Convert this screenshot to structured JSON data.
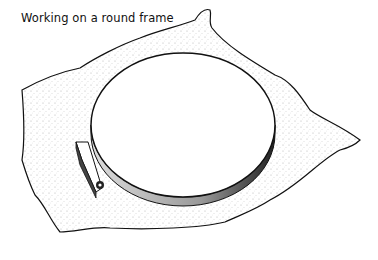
{
  "caption": "Working on a round frame",
  "illustration": {
    "subject": "round embroidery frame (hoop) clamped over fabric",
    "parts": [
      "fabric",
      "outer hoop",
      "inner hoop",
      "tension screw"
    ]
  },
  "colors": {
    "ink": "#111111",
    "background": "#ffffff"
  }
}
